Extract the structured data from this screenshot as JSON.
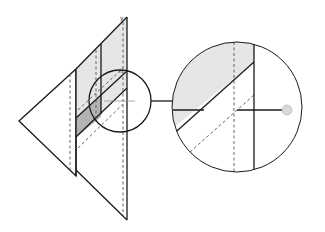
{
  "diagram": {
    "title": "",
    "labels": {
      "axis_top": "y",
      "small_mark": "n"
    },
    "colors": {
      "stroke": "#1a1a1a",
      "light_fill": "#e6e6e6",
      "dark_fill": "#b3b3b3",
      "dashed": "#555555",
      "dot": "#d9d9d9"
    },
    "components": [
      "left-triangle-plane",
      "right-triangle-plane",
      "shaded-parallelogram",
      "dark-shaded-band",
      "focus-circle",
      "magnified-circle",
      "connector-line",
      "gray-dot"
    ]
  }
}
